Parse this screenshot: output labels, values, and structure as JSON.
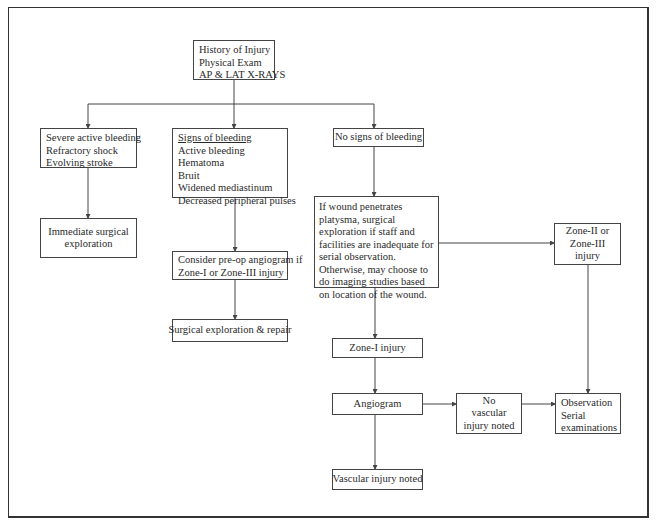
{
  "diagram": {
    "type": "flowchart",
    "nodes": {
      "start": {
        "lines": [
          "History of Injury",
          "Physical Exam",
          "AP & LAT X-RAYS"
        ]
      },
      "severe": {
        "lines": [
          "Severe active bleeding",
          "Refractory shock",
          "Evolving stroke"
        ]
      },
      "signs": {
        "heading": "Signs of bleeding",
        "lines": [
          "Active bleeding",
          "Hematoma",
          "Bruit",
          "Widened mediastinum",
          "Decreased peripheral pulses"
        ]
      },
      "no_signs": {
        "text": "No signs of bleeding"
      },
      "immediate": {
        "lines": [
          "Immediate surgical",
          "exploration"
        ]
      },
      "preop": {
        "lines": [
          "Consider pre-op angiogram if",
          "Zone-I or Zone-III injury"
        ]
      },
      "repair": {
        "text": "Surgical exploration & repair"
      },
      "penetrates": {
        "text": "If wound penetrates platysma, surgical exploration if staff and facilities are inadequate for serial observation. Otherwise, may choose to do imaging studies based on location of the wound."
      },
      "zone23": {
        "lines": [
          "Zone-II or",
          "Zone-III",
          "injury"
        ]
      },
      "zone1": {
        "text": "Zone-I injury"
      },
      "angiogram": {
        "text": "Angiogram"
      },
      "no_vascular": {
        "lines": [
          "No",
          "vascular",
          "injury noted"
        ]
      },
      "observation": {
        "lines": [
          "Observation",
          "Serial",
          "examinations"
        ]
      },
      "vascular": {
        "text": "Vascular injury noted"
      }
    },
    "edges": [
      [
        "start",
        "severe"
      ],
      [
        "start",
        "signs"
      ],
      [
        "start",
        "no_signs"
      ],
      [
        "severe",
        "immediate"
      ],
      [
        "signs",
        "preop"
      ],
      [
        "preop",
        "repair"
      ],
      [
        "no_signs",
        "penetrates"
      ],
      [
        "penetrates",
        "zone23"
      ],
      [
        "penetrates",
        "zone1"
      ],
      [
        "zone1",
        "angiogram"
      ],
      [
        "angiogram",
        "no_vascular"
      ],
      [
        "angiogram",
        "vascular"
      ],
      [
        "no_vascular",
        "observation"
      ],
      [
        "zone23",
        "observation"
      ]
    ]
  }
}
